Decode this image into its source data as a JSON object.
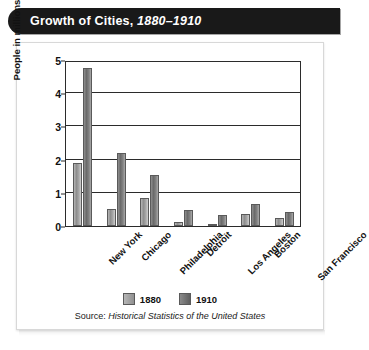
{
  "banner": {
    "title_main": "Growth of Cities,",
    "title_years": "1880–1910"
  },
  "legend": {
    "items": [
      {
        "label": "1880",
        "color": "#9a9a9a"
      },
      {
        "label": "1910",
        "color": "#6a6a6a"
      }
    ]
  },
  "source": {
    "prefix": "Source: ",
    "work": "Historical Statistics of the United States"
  },
  "axis": {
    "y_ticks": [
      "0",
      "1",
      "2",
      "3",
      "4",
      "5"
    ],
    "y_title": "People in millions"
  },
  "chart_data": {
    "type": "bar",
    "title": "Growth of Cities, 1880–1910",
    "xlabel": "",
    "ylabel": "People in millions",
    "ylim": [
      0,
      5
    ],
    "ytick_step": 1,
    "grid": true,
    "legend_position": "bottom",
    "categories": [
      "New York",
      "Chicago",
      "Philadelphia",
      "Detroit",
      "Los Angeles",
      "Boston",
      "San Francisco"
    ],
    "series": [
      {
        "name": "1880",
        "color": "#9a9a9a",
        "values": [
          1.9,
          0.5,
          0.85,
          0.12,
          0.01,
          0.36,
          0.23
        ]
      },
      {
        "name": "1910",
        "color": "#6a6a6a",
        "values": [
          4.77,
          2.2,
          1.55,
          0.47,
          0.32,
          0.67,
          0.42
        ]
      }
    ],
    "source": "Source: Historical Statistics of the United States"
  }
}
